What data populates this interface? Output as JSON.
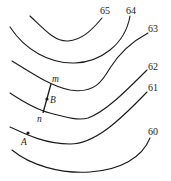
{
  "diagram": {
    "type": "contour-map",
    "contours": [
      {
        "value": "65",
        "path": "M30,16 C45,30 55,42 68,41 C82,40 92,30 102,18",
        "label_x": 100,
        "label_y": 14
      },
      {
        "value": "64",
        "path": "M10,27 C25,50 50,64 75,63 C100,62 125,45 130,16",
        "label_x": 126,
        "label_y": 14
      },
      {
        "value": "63",
        "path": "M12,61 C30,72 50,86 70,90 C95,94 103,80 110,68 C120,52 135,40 148,33",
        "label_x": 148,
        "label_y": 32
      },
      {
        "value": "62",
        "path": "M10,93 C25,103 38,110 50,113 C65,117 78,121 88,118 C105,112 125,92 147,70",
        "label_x": 148,
        "label_y": 70
      },
      {
        "value": "61",
        "path": "M10,127 C25,134 45,144 70,144 C95,144 120,120 147,92",
        "label_x": 148,
        "label_y": 91
      },
      {
        "value": "60",
        "path": "M12,150 C30,165 60,174 90,172 C120,170 142,158 150,138",
        "label_x": 148,
        "label_y": 135
      }
    ],
    "segment": {
      "from": "m",
      "to": "n",
      "x1": 51,
      "y1": 84,
      "x2": 43,
      "y2": 113
    },
    "points": [
      {
        "name": "m",
        "x": 50,
        "y": 82,
        "label_x": 52,
        "label_y": 82
      },
      {
        "name": "B",
        "x": 47,
        "y": 99,
        "label_x": 50,
        "label_y": 103
      },
      {
        "name": "n",
        "x": 43,
        "y": 113,
        "label_x": 37,
        "label_y": 122
      },
      {
        "name": "A",
        "x": 28,
        "y": 133,
        "label_x": 21,
        "label_y": 145
      }
    ],
    "stroke_color": "#1a1a1a"
  }
}
